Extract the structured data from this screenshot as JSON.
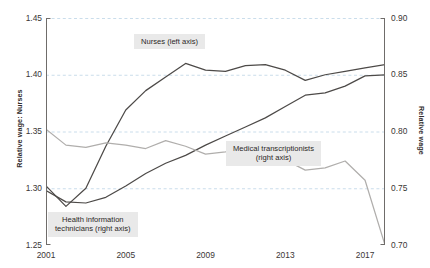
{
  "chart_data": {
    "type": "line",
    "title": "",
    "xlabel": "",
    "ylabel": "Relative wage: Nurses",
    "ylabel_right": "Relative wage",
    "xlim": [
      2001,
      2018
    ],
    "ylim": [
      1.25,
      1.45
    ],
    "ylim_right": [
      0.7,
      0.9
    ],
    "grid": true,
    "legend": "inline-annotations",
    "xticks": [
      2001,
      2005,
      2009,
      2013,
      2017
    ],
    "xticklabels": [
      "2001",
      "2005",
      "2009",
      "2013",
      "2017"
    ],
    "yticks_left": [
      1.25,
      1.3,
      1.35,
      1.4,
      1.45
    ],
    "yticklabels_left": [
      "1.25",
      "1.30",
      "1.35",
      "1.40",
      "1.45"
    ],
    "yticks_right": [
      0.7,
      0.75,
      0.8,
      0.85,
      0.9
    ],
    "yticklabels_right": [
      "0.70",
      "0.75",
      "0.80",
      "0.85",
      "0.90"
    ],
    "x": [
      2001,
      2002,
      2003,
      2004,
      2005,
      2006,
      2007,
      2008,
      2009,
      2010,
      2011,
      2012,
      2013,
      2014,
      2015,
      2016,
      2017,
      2018
    ],
    "series": [
      {
        "name": "Nurses (left axis)",
        "axis": "left",
        "color": "#4d4a48",
        "values": [
          1.302,
          1.284,
          1.3,
          1.337,
          1.369,
          1.386,
          1.398,
          1.41,
          1.404,
          1.403,
          1.408,
          1.409,
          1.404,
          1.395,
          1.4,
          1.403,
          1.406,
          1.409
        ]
      },
      {
        "name": "Health information technicians (right axis)",
        "axis": "right",
        "color": "#4d4a48",
        "values": [
          0.748,
          0.738,
          0.737,
          0.742,
          0.752,
          0.763,
          0.772,
          0.779,
          0.788,
          0.796,
          0.804,
          0.812,
          0.822,
          0.832,
          0.834,
          0.84,
          0.849,
          0.85
        ]
      },
      {
        "name": "Medical transcriptionists (right axis)",
        "axis": "right",
        "color": "#b0aeac",
        "values": [
          0.802,
          0.788,
          0.786,
          0.79,
          0.788,
          0.785,
          0.792,
          0.787,
          0.78,
          0.782,
          0.786,
          0.783,
          0.775,
          0.766,
          0.768,
          0.774,
          0.757,
          0.7
        ]
      }
    ],
    "annotations": [
      {
        "name": "nurses-label",
        "text": "Nurses (left axis)"
      },
      {
        "name": "medical-transcriptionists-label",
        "text": "Medical transcriptionists\n(right axis)"
      },
      {
        "name": "health-information-technicians-label",
        "text": "Health information\ntechnicians (right axis)"
      }
    ],
    "colors": {
      "grid": "#bcd4e6",
      "axis": "#6f6c6a",
      "annotation_background": "#e9e9e9",
      "dark_line": "#4d4a48",
      "light_line": "#b0aeac"
    }
  }
}
